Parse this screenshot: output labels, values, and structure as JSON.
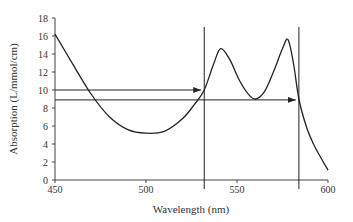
{
  "chart_data": {
    "type": "line",
    "title": "",
    "xlabel": "Wavelength (nm)",
    "ylabel": "Absorption (L/mmol/cm)",
    "xlim": [
      450,
      600
    ],
    "ylim": [
      0,
      18
    ],
    "x_ticks": [
      450,
      500,
      550,
      600
    ],
    "y_ticks": [
      0,
      2,
      4,
      6,
      8,
      10,
      12,
      14,
      16,
      18
    ],
    "grid": false,
    "series": [
      {
        "name": "absorption spectrum",
        "x": [
          450,
          460,
          470,
          480,
          490,
          500,
          510,
          520,
          527,
          532,
          537,
          541,
          546,
          551,
          556,
          560,
          565,
          570,
          575,
          578,
          581,
          584,
          588,
          592,
          596,
          600
        ],
        "y": [
          16.2,
          12.8,
          9.5,
          7.0,
          5.6,
          5.2,
          5.4,
          6.8,
          8.5,
          10.0,
          12.8,
          14.6,
          13.4,
          11.2,
          9.6,
          9.0,
          9.8,
          12.0,
          14.6,
          15.6,
          13.0,
          9.0,
          6.0,
          4.0,
          2.5,
          1.1
        ]
      }
    ],
    "annotations": [
      {
        "type": "vline",
        "x": 532
      },
      {
        "type": "vline",
        "x": 584
      },
      {
        "type": "arrow",
        "y": 10,
        "from_x": 450,
        "to_x": 532
      },
      {
        "type": "arrow",
        "y": 8.9,
        "from_x": 450,
        "to_x": 584
      }
    ]
  }
}
